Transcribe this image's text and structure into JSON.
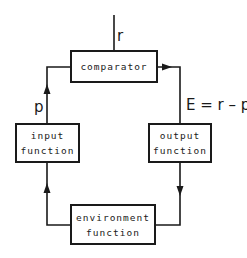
{
  "diagram": {
    "type": "feedback control loop",
    "nodes": {
      "comparator": {
        "lines": [
          "comparator"
        ]
      },
      "input": {
        "lines": [
          "input",
          "function"
        ]
      },
      "output": {
        "lines": [
          "output",
          "function"
        ]
      },
      "environment": {
        "lines": [
          "environment",
          "function"
        ]
      }
    },
    "labels": {
      "reference": "r",
      "perception": "p",
      "error": "E = r – p"
    },
    "edges": [
      {
        "from": "reference",
        "to": "comparator",
        "label": "r"
      },
      {
        "from": "comparator",
        "to": "output",
        "label": "E = r – p"
      },
      {
        "from": "output",
        "to": "environment"
      },
      {
        "from": "environment",
        "to": "input"
      },
      {
        "from": "input",
        "to": "comparator",
        "label": "p"
      }
    ],
    "line_color": "#1a1a1a"
  }
}
